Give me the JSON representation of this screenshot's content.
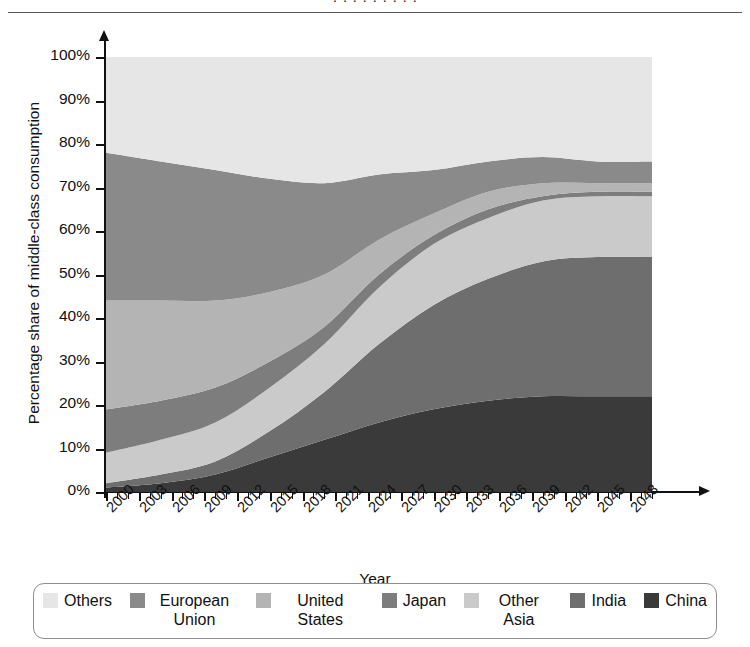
{
  "page": {
    "clipped_header_text": "· · · · · · · · ·"
  },
  "axes": {
    "y_title": "Percentage share of middle-class consumption",
    "x_title": "Year",
    "y_ticks": [
      "0%",
      "10%",
      "20%",
      "30%",
      "40%",
      "50%",
      "60%",
      "70%",
      "80%",
      "90%",
      "100%"
    ],
    "x_ticks": [
      "2000",
      "2003",
      "2006",
      "2009",
      "2012",
      "2015",
      "2018",
      "2021",
      "2024",
      "2027",
      "2030",
      "2033",
      "2036",
      "2039",
      "2042",
      "2045",
      "2048"
    ]
  },
  "legend": {
    "items": [
      {
        "label": "Others",
        "color": "#e6e6e6"
      },
      {
        "label": "European Union",
        "color": "#8a8a8a"
      },
      {
        "label": "United States",
        "color": "#b4b4b4"
      },
      {
        "label": "Japan",
        "color": "#7d7d7d"
      },
      {
        "label": "Other Asia",
        "color": "#cacaca"
      },
      {
        "label": "India",
        "color": "#6e6e6e"
      },
      {
        "label": "China",
        "color": "#3a3a3a"
      }
    ]
  },
  "chart_data": {
    "type": "area",
    "stacked": true,
    "normalized_percent": true,
    "title": "",
    "xlabel": "Year",
    "ylabel": "Percentage share of middle-class consumption",
    "xlim": [
      2000,
      2050
    ],
    "ylim": [
      0,
      100
    ],
    "grid": false,
    "legend_position": "bottom",
    "stack_order_bottom_to_top": [
      "China",
      "India",
      "Other Asia",
      "Japan",
      "United States",
      "European Union",
      "Others"
    ],
    "x": [
      2000,
      2005,
      2010,
      2015,
      2020,
      2025,
      2030,
      2035,
      2040,
      2045,
      2050
    ],
    "series": [
      {
        "name": "China",
        "color": "#3a3a3a",
        "values": [
          1,
          2,
          4,
          8,
          12,
          16,
          19,
          21,
          22,
          22,
          22
        ]
      },
      {
        "name": "India",
        "color": "#6e6e6e",
        "values": [
          1,
          2,
          3,
          6,
          11,
          18,
          24,
          28,
          31,
          32,
          32
        ]
      },
      {
        "name": "Other Asia",
        "color": "#cacaca",
        "values": [
          7,
          8,
          9,
          10,
          11,
          13,
          14,
          14,
          14,
          14,
          14
        ]
      },
      {
        "name": "Japan",
        "color": "#7d7d7d",
        "values": [
          10,
          9,
          8,
          6,
          4,
          3,
          2,
          2,
          1,
          1,
          1
        ]
      },
      {
        "name": "United States",
        "color": "#b4b4b4",
        "values": [
          25,
          23,
          20,
          16,
          12,
          8,
          5,
          4,
          3,
          2,
          2
        ]
      },
      {
        "name": "European Union",
        "color": "#8a8a8a",
        "values": [
          34,
          32,
          30,
          26,
          21,
          15,
          10,
          7,
          6,
          5,
          5
        ]
      },
      {
        "name": "Others",
        "color": "#e6e6e6",
        "values": [
          22,
          24,
          26,
          28,
          29,
          27,
          26,
          24,
          23,
          24,
          24
        ]
      }
    ],
    "cumulative_top_boundaries": {
      "China": [
        1,
        2,
        4,
        8,
        12,
        16,
        19,
        21,
        22,
        22,
        22
      ],
      "India": [
        2,
        4,
        7,
        14,
        23,
        34,
        43,
        49,
        53,
        54,
        54
      ],
      "Other Asia": [
        9,
        12,
        16,
        24,
        34,
        47,
        57,
        63,
        67,
        68,
        68
      ],
      "Japan": [
        19,
        21,
        24,
        30,
        38,
        50,
        59,
        65,
        68,
        69,
        69
      ],
      "United States": [
        44,
        44,
        44,
        46,
        50,
        58,
        64,
        69,
        71,
        71,
        71
      ],
      "European Union": [
        78,
        76,
        74,
        72,
        71,
        73,
        74,
        76,
        77,
        76,
        76
      ],
      "Others": [
        100,
        100,
        100,
        100,
        100,
        100,
        100,
        100,
        100,
        100,
        100
      ]
    }
  }
}
